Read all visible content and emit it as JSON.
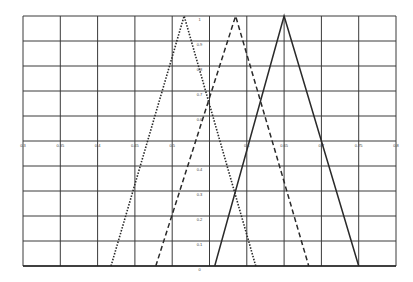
{
  "chart_data": {
    "type": "line",
    "title": "",
    "xlabel": "",
    "ylabel": "",
    "xlim": [
      0.3,
      0.8
    ],
    "ylim": [
      0,
      1
    ],
    "grid": true,
    "legend": null,
    "x_ticks": [
      "0.3",
      "0.35",
      "0.4",
      "0.45",
      "0.5",
      "",
      "0.6",
      "0.65",
      "0.7",
      "0.75",
      "0.8"
    ],
    "y_ticks": [
      "0",
      "0.1",
      "0.2",
      "0.3",
      "0.4",
      "",
      "0.6",
      "0.7",
      "0.8",
      "0.9",
      "1"
    ],
    "x_axis_at_y": 0.5,
    "y_axis_at_x": 0.55,
    "series": [
      {
        "name": "dotted-triangle",
        "style": "dotted",
        "x": [
          0.418,
          0.516,
          0.612
        ],
        "y": [
          0,
          1,
          0
        ]
      },
      {
        "name": "dashed-triangle",
        "style": "dashed",
        "x": [
          0.478,
          0.585,
          0.683
        ],
        "y": [
          0,
          1,
          0
        ]
      },
      {
        "name": "solid-triangle",
        "style": "solid",
        "x": [
          0.557,
          0.65,
          0.75
        ],
        "y": [
          0,
          1,
          0
        ]
      }
    ]
  },
  "colors": {
    "grid": "#3a3a3a",
    "line": "#2a2a2a",
    "background": "#ffffff"
  }
}
